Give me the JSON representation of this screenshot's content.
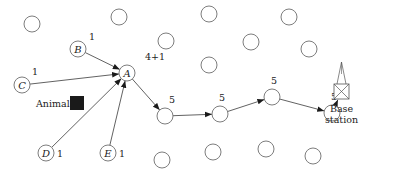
{
  "diagram": {
    "type": "sensor-network-routing",
    "node_radius": 8,
    "idle_nodes": [
      {
        "x": 32,
        "y": 24
      },
      {
        "x": 119,
        "y": 17
      },
      {
        "x": 166,
        "y": 41
      },
      {
        "x": 209,
        "y": 14
      },
      {
        "x": 289,
        "y": 17
      },
      {
        "x": 251,
        "y": 42
      },
      {
        "x": 309,
        "y": 49
      },
      {
        "x": 209,
        "y": 65
      },
      {
        "x": 162,
        "y": 160
      },
      {
        "x": 213,
        "y": 152
      },
      {
        "x": 266,
        "y": 149
      },
      {
        "x": 313,
        "y": 156
      }
    ],
    "named_nodes": [
      {
        "id": "A",
        "label": "A",
        "x": 127,
        "y": 73,
        "weight": "4+1",
        "wx": 145,
        "wy": 60
      },
      {
        "id": "B",
        "label": "B",
        "x": 78,
        "y": 49,
        "weight": "1",
        "wx": 89,
        "wy": 40
      },
      {
        "id": "C",
        "label": "C",
        "x": 22,
        "y": 85,
        "weight": "1",
        "wx": 32,
        "wy": 75
      },
      {
        "id": "D",
        "label": "D",
        "x": 46,
        "y": 153,
        "weight": "1",
        "wx": 57,
        "wy": 157
      },
      {
        "id": "E",
        "label": "E",
        "x": 108,
        "y": 153,
        "weight": "1",
        "wx": 119,
        "wy": 157
      }
    ],
    "relay_nodes": [
      {
        "id": "R1",
        "x": 165,
        "y": 116,
        "weight": "5",
        "wx": 169,
        "wy": 103
      },
      {
        "id": "R2",
        "x": 220,
        "y": 114,
        "weight": "5",
        "wx": 219,
        "wy": 101
      },
      {
        "id": "R3",
        "x": 272,
        "y": 97,
        "weight": "5",
        "wx": 271,
        "wy": 84
      },
      {
        "id": "R4",
        "x": 332,
        "y": 113,
        "weight": "5",
        "wx": 331,
        "wy": 100
      }
    ],
    "animal": {
      "label": "Animal",
      "x": 70,
      "y": 96,
      "size": 14,
      "color": "#1a1a1a"
    },
    "base_station": {
      "line1": "Base",
      "line2": "station",
      "x": 334,
      "y": 84,
      "size": 15
    },
    "edges": [
      [
        "B",
        "A"
      ],
      [
        "C",
        "A"
      ],
      [
        "D",
        "A"
      ],
      [
        "E",
        "A"
      ],
      [
        "A",
        "R1"
      ],
      [
        "R1",
        "R2"
      ],
      [
        "R2",
        "R3"
      ],
      [
        "R3",
        "R4"
      ],
      [
        "R4",
        "BS"
      ]
    ]
  }
}
